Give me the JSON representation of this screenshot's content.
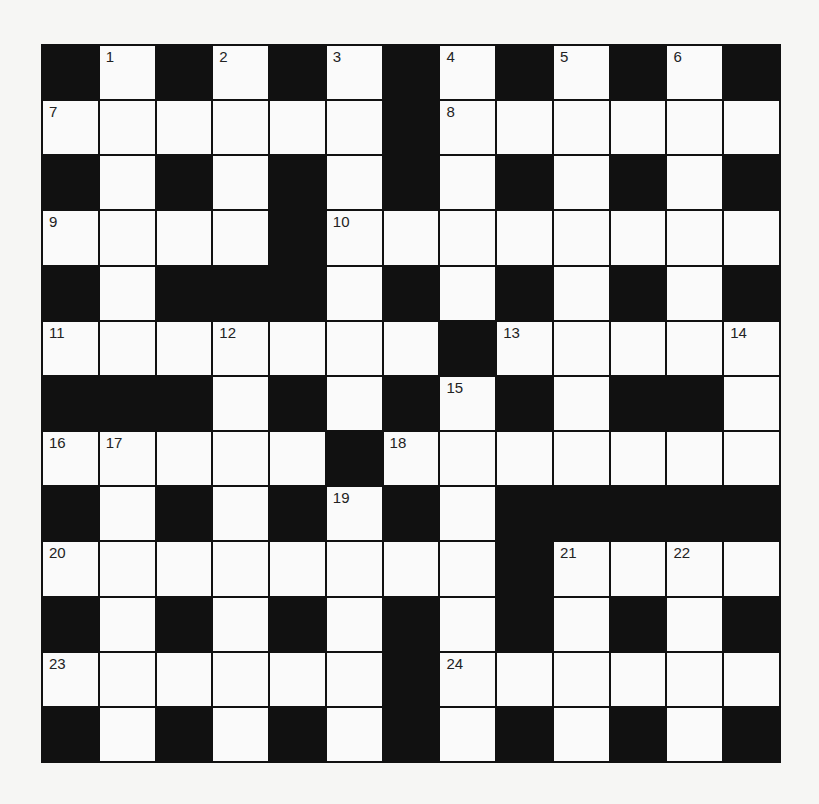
{
  "puzzle": {
    "rows": 13,
    "cols": 13,
    "layout": [
      "BWBWBWBWBWBWB",
      "WWWWWWBWWWWWW",
      "BWBWBWBWBWBWB",
      "WWWWBWWWWWWWW",
      "BWBBBWBWBWBWB",
      "WWWWWWWBWWWWW",
      "BBBWBWBWBWBBW",
      "WWWWWBWWWWWWW",
      "BWBWBWBWBBBBB",
      "WWWWWWWWBWWWW",
      "BWBWBWBWBWBWB",
      "WWWWWWBWWWWWW",
      "BWBWBWBWBWBWB"
    ],
    "numbers": [
      {
        "row": 0,
        "col": 1,
        "n": "1"
      },
      {
        "row": 0,
        "col": 3,
        "n": "2"
      },
      {
        "row": 0,
        "col": 5,
        "n": "3"
      },
      {
        "row": 0,
        "col": 7,
        "n": "4"
      },
      {
        "row": 0,
        "col": 9,
        "n": "5"
      },
      {
        "row": 0,
        "col": 11,
        "n": "6"
      },
      {
        "row": 1,
        "col": 0,
        "n": "7"
      },
      {
        "row": 1,
        "col": 7,
        "n": "8"
      },
      {
        "row": 3,
        "col": 0,
        "n": "9"
      },
      {
        "row": 3,
        "col": 5,
        "n": "10"
      },
      {
        "row": 5,
        "col": 0,
        "n": "11"
      },
      {
        "row": 5,
        "col": 3,
        "n": "12"
      },
      {
        "row": 5,
        "col": 8,
        "n": "13"
      },
      {
        "row": 5,
        "col": 12,
        "n": "14"
      },
      {
        "row": 6,
        "col": 7,
        "n": "15"
      },
      {
        "row": 7,
        "col": 0,
        "n": "16"
      },
      {
        "row": 7,
        "col": 1,
        "n": "17"
      },
      {
        "row": 7,
        "col": 6,
        "n": "18"
      },
      {
        "row": 8,
        "col": 5,
        "n": "19"
      },
      {
        "row": 9,
        "col": 0,
        "n": "20"
      },
      {
        "row": 9,
        "col": 9,
        "n": "21"
      },
      {
        "row": 9,
        "col": 11,
        "n": "22"
      },
      {
        "row": 11,
        "col": 0,
        "n": "23"
      },
      {
        "row": 11,
        "col": 7,
        "n": "24"
      }
    ]
  },
  "colors": {
    "background": "#f6f6f4",
    "block": "#111111",
    "cell": "#fafafa"
  }
}
